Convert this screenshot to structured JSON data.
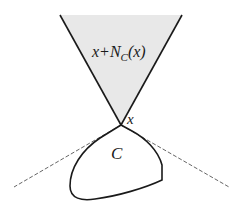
{
  "diagram": {
    "labels": {
      "cone_prefix": "x+N",
      "cone_sub": "C",
      "cone_suffix": "(x)",
      "apex": "x",
      "set": "C"
    },
    "colors": {
      "cone_fill": "#e8e8e8",
      "stroke": "#1a1a1a",
      "tangent_lines": "#555555",
      "background": "#ffffff"
    },
    "geometry": {
      "apex": [
        121,
        125
      ],
      "cone_top_left": [
        60,
        15
      ],
      "cone_top_right": [
        182,
        15
      ],
      "tangent_left_end": [
        14,
        187
      ],
      "tangent_right_end": [
        229,
        187
      ]
    }
  }
}
